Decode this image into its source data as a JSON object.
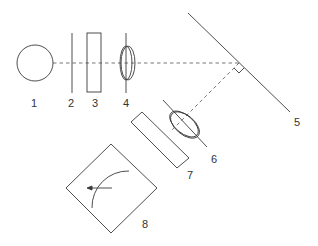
{
  "diagram": {
    "type": "optical-setup",
    "colors": {
      "line": "#3a3a3a",
      "dash": "#555555",
      "text": "#333333",
      "background": "#ffffff"
    },
    "labels": {
      "l1": "1",
      "l2": "2",
      "l3": "3",
      "l4": "4",
      "l5": "5",
      "l6": "6",
      "l7": "7",
      "l8": "8"
    },
    "components": [
      {
        "id": "1",
        "shape": "circle"
      },
      {
        "id": "2",
        "shape": "vertical-line"
      },
      {
        "id": "3",
        "shape": "rectangle"
      },
      {
        "id": "4",
        "shape": "lens"
      },
      {
        "id": "5",
        "shape": "mirror-line"
      },
      {
        "id": "6",
        "shape": "lens-tilted"
      },
      {
        "id": "7",
        "shape": "rectangle-tilted"
      },
      {
        "id": "8",
        "shape": "diamond-with-arc-arrow"
      }
    ]
  }
}
